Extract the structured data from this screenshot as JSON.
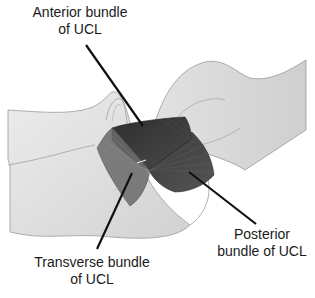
{
  "figure": {
    "colors": {
      "bone_fill": "#e4e4e4",
      "bone_outline": "#9a9a9a",
      "ligament_dark": "#3c3c3c",
      "ligament_mid": "#5a5a5a",
      "leader_line": "#111111",
      "text": "#1a1a1a"
    },
    "labels": [
      {
        "id": "anterior",
        "line1": "Anterior bundle",
        "line2": "of UCL"
      },
      {
        "id": "transverse",
        "line1": "Transverse bundle",
        "line2": "of UCL"
      },
      {
        "id": "posterior",
        "line1": "Posterior",
        "line2": "bundle of UCL"
      }
    ]
  }
}
